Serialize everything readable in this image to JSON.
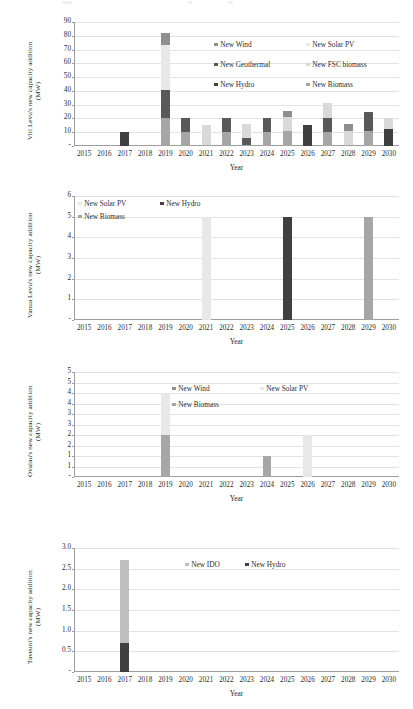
{
  "colors": {
    "wind": "#8f8f8f",
    "solar_pv": "#e8e8e8",
    "geothermal": "#595959",
    "fsc_biomass": "#d9d9d9",
    "hydro": "#404040",
    "biomass": "#a6a6a6",
    "ido": "#bfbfbf",
    "grid": "#e3e3e3",
    "axis": "#9d9d9d",
    "text": "#2b2b2b"
  },
  "charts": [
    {
      "id": "viti-levu",
      "ylabel": "Viti Levu's new capacity addition\n(MW)",
      "xlabel": "Year",
      "ytitle_lines": [
        "Viti Levu's new capacity addition",
        "(MW)"
      ],
      "chart_data": {
        "type": "bar",
        "stacked": true,
        "title": "",
        "xlabel": "Year",
        "ylabel": "Viti Levu's new capacity addition (MW)",
        "ylim": [
          0,
          90
        ],
        "yticks": [
          "-",
          "10",
          "20",
          "30",
          "40",
          "50",
          "60",
          "70",
          "80",
          "90"
        ],
        "ytick_values": [
          0,
          10,
          20,
          30,
          40,
          50,
          60,
          70,
          80,
          90
        ],
        "grid": true,
        "legend_position": "inside-top-right",
        "categories": [
          "2015",
          "2016",
          "2017",
          "2018",
          "2019",
          "2020",
          "2021",
          "2022",
          "2023",
          "2024",
          "2025",
          "2026",
          "2027",
          "2028",
          "2029",
          "2030"
        ],
        "series": [
          {
            "name": "New Biomass",
            "color_key": "biomass",
            "values": [
              0,
              0,
              0,
              0,
              20,
              10,
              1,
              10,
              1,
              10,
              11,
              0,
              10,
              1,
              11,
              0
            ]
          },
          {
            "name": "New Hydro",
            "color_key": "hydro",
            "values": [
              0,
              0,
              10,
              0,
              0,
              0,
              0,
              0,
              0,
              0,
              0,
              15.5,
              0,
              0,
              0,
              12.5
            ]
          },
          {
            "name": "New Geothermal",
            "color_key": "geothermal",
            "values": [
              0,
              0,
              0,
              0,
              21,
              10,
              0,
              10,
              5,
              10,
              0,
              0,
              10,
              0,
              14,
              0
            ]
          },
          {
            "name": "New FSC biomass",
            "color_key": "fsc_biomass",
            "values": [
              0,
              0,
              0,
              0,
              0,
              0,
              14.5,
              0,
              10,
              0,
              10,
              0,
              11,
              10,
              0,
              8
            ]
          },
          {
            "name": "New Solar PV",
            "color_key": "solar_pv",
            "values": [
              0,
              0,
              0,
              0,
              32,
              0,
              0,
              0,
              0,
              0,
              0,
              0,
              0,
              0,
              0,
              0
            ]
          },
          {
            "name": "New Wind",
            "color_key": "wind",
            "values": [
              0,
              0,
              0,
              0,
              9,
              0,
              0,
              0,
              0,
              0,
              4.5,
              0,
              0,
              5,
              0,
              0
            ]
          }
        ]
      },
      "legend": [
        {
          "label": "New Wind",
          "color_key": "wind"
        },
        {
          "label": "New Solar PV",
          "color_key": "solar_pv"
        },
        {
          "label": "New Geothermal",
          "color_key": "geothermal"
        },
        {
          "label": "New FSC biomass",
          "color_key": "fsc_biomass"
        },
        {
          "label": "New Hydro",
          "color_key": "hydro"
        },
        {
          "label": "New Biomass",
          "color_key": "biomass"
        }
      ]
    },
    {
      "id": "vanua-levu",
      "ylabel": "Vanua Levu's new capacity addition\n(MW)",
      "xlabel": "Year",
      "ytitle_lines": [
        "Vanua Levu's new capacity addition",
        "(MW)"
      ],
      "chart_data": {
        "type": "bar",
        "stacked": true,
        "title": "",
        "xlabel": "Year",
        "ylabel": "Vanua Levu's new capacity addition (MW)",
        "ylim": [
          0,
          6
        ],
        "yticks": [
          "-",
          "1",
          "2",
          "3",
          "4",
          "5",
          "6"
        ],
        "ytick_values": [
          0,
          1,
          2,
          3,
          4,
          5,
          6
        ],
        "grid": true,
        "legend_position": "inside-top-left",
        "categories": [
          "2015",
          "2016",
          "2017",
          "2018",
          "2019",
          "2020",
          "2021",
          "2022",
          "2023",
          "2024",
          "2025",
          "2026",
          "2027",
          "2028",
          "2029",
          "2030"
        ],
        "series": [
          {
            "name": "New Solar PV",
            "color_key": "solar_pv",
            "values": [
              0,
              0,
              0,
              0,
              0,
              0,
              5,
              0,
              0,
              0,
              0,
              0,
              0,
              0,
              0,
              0
            ]
          },
          {
            "name": "New Hydro",
            "color_key": "hydro",
            "values": [
              0,
              0,
              0,
              0,
              0,
              0,
              0,
              0,
              0,
              0,
              5,
              0,
              0,
              0,
              0,
              0
            ]
          },
          {
            "name": "New Biomass",
            "color_key": "biomass",
            "values": [
              0,
              0,
              0,
              0,
              0,
              0,
              0,
              0,
              0,
              0,
              0,
              0,
              0,
              0,
              5,
              0
            ]
          }
        ]
      },
      "legend": [
        {
          "label": "New Solar PV",
          "color_key": "solar_pv"
        },
        {
          "label": "New Hydro",
          "color_key": "hydro"
        },
        {
          "label": "New Biomass",
          "color_key": "biomass"
        }
      ]
    },
    {
      "id": "ovalau",
      "ylabel": "Ovalau's new capacity addition\n(MW)",
      "xlabel": "Year",
      "ytitle_lines": [
        "Ovalau's new capacity addition",
        "(MW)"
      ],
      "chart_data": {
        "type": "bar",
        "stacked": true,
        "title": "",
        "xlabel": "Year",
        "ylabel": "Ovalau's new capacity addition (MW)",
        "ylim": [
          0,
          5
        ],
        "yticks": [
          "-",
          "1",
          "1",
          "2",
          "2",
          "3",
          "3",
          "4",
          "4",
          "5"
        ],
        "ytick_values": [
          0,
          0.5,
          1,
          1.5,
          2,
          2.5,
          3,
          3.5,
          4,
          4.5,
          5
        ],
        "grid": true,
        "legend_position": "inside-top-right",
        "categories": [
          "2015",
          "2016",
          "2017",
          "2018",
          "2019",
          "2020",
          "2021",
          "2022",
          "2023",
          "2024",
          "2025",
          "2026",
          "2027",
          "2028",
          "2029",
          "2030"
        ],
        "series": [
          {
            "name": "New Biomass",
            "color_key": "biomass",
            "values": [
              0,
              0,
              0,
              0,
              2,
              0,
              0,
              0,
              0,
              1,
              0,
              0,
              0,
              0,
              0,
              0
            ]
          },
          {
            "name": "New Solar PV",
            "color_key": "solar_pv",
            "values": [
              0,
              0,
              0,
              0,
              2,
              0,
              0,
              0,
              0,
              0,
              0,
              2,
              0,
              0,
              0,
              0
            ]
          },
          {
            "name": "New Wind",
            "color_key": "wind",
            "values": [
              0,
              0,
              0,
              0,
              0,
              0,
              0,
              0,
              0,
              0,
              0,
              0,
              0,
              0,
              0,
              0
            ]
          }
        ]
      },
      "legend": [
        {
          "label": "New Wind",
          "color_key": "wind"
        },
        {
          "label": "New Solar PV",
          "color_key": "solar_pv"
        },
        {
          "label": "New Biomass",
          "color_key": "biomass"
        }
      ]
    },
    {
      "id": "taveuni",
      "ylabel": "Taveuni's new capacity addition\n(MW)",
      "xlabel": "Year",
      "ytitle_lines": [
        "Taveuni's new capacity addition",
        "(MW)"
      ],
      "chart_data": {
        "type": "bar",
        "stacked": true,
        "title": "",
        "xlabel": "Year",
        "ylabel": "Taveuni's new capacity addition (MW)",
        "ylim": [
          0,
          3.0
        ],
        "yticks": [
          "-",
          "0.5",
          "1.0",
          "1.5",
          "2.0",
          "2.5",
          "3.0"
        ],
        "ytick_values": [
          0,
          0.5,
          1.0,
          1.5,
          2.0,
          2.5,
          3.0
        ],
        "grid": true,
        "legend_position": "inside-top-center",
        "categories": [
          "2015",
          "2016",
          "2017",
          "2018",
          "2019",
          "2020",
          "2021",
          "2022",
          "2023",
          "2024",
          "2025",
          "2026",
          "2027",
          "2028",
          "2029",
          "2030"
        ],
        "series": [
          {
            "name": "New Hydro",
            "color_key": "hydro",
            "values": [
              0,
              0,
              0.7,
              0,
              0,
              0,
              0,
              0,
              0,
              0,
              0,
              0,
              0,
              0,
              0,
              0
            ]
          },
          {
            "name": "New IDO",
            "color_key": "ido",
            "values": [
              0,
              0,
              2.0,
              0,
              0,
              0,
              0,
              0,
              0,
              0,
              0,
              0,
              0,
              0,
              0,
              0
            ]
          }
        ]
      },
      "legend": [
        {
          "label": "New IDO",
          "color_key": "ido"
        },
        {
          "label": "New Hydro",
          "color_key": "hydro"
        }
      ]
    }
  ]
}
